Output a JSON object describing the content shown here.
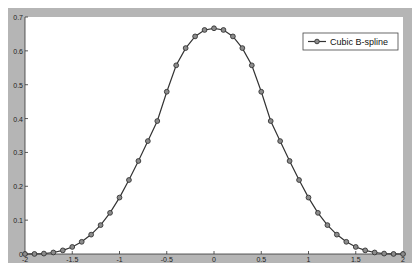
{
  "chart_data": {
    "type": "line",
    "title": "",
    "xlabel": "",
    "ylabel": "",
    "xlim": [
      -2,
      2
    ],
    "ylim": [
      0,
      0.7
    ],
    "grid": false,
    "legend_position": "upper right",
    "x_ticks": [
      -2,
      -1.5,
      -1,
      -0.5,
      0,
      0.5,
      1,
      1.5,
      2
    ],
    "x_tick_labels": [
      "-2",
      "-1.5",
      "-1",
      "-0.5",
      "0",
      "0.5",
      "1",
      "1.5",
      "2"
    ],
    "y_ticks": [
      0,
      0.1,
      0.2,
      0.3,
      0.4,
      0.5,
      0.6,
      0.7
    ],
    "y_tick_labels": [
      "0",
      "0.1",
      "0.2",
      "0.3",
      "0.4",
      "0.5",
      "0.6",
      "0.7"
    ],
    "series": [
      {
        "name": "Cubic B-spline",
        "marker": "circle",
        "color": "#333333",
        "x": [
          -2,
          -1.9,
          -1.8,
          -1.7,
          -1.6,
          -1.5,
          -1.4,
          -1.3,
          -1.2,
          -1.1,
          -1,
          -0.9,
          -0.8,
          -0.7,
          -0.6,
          -0.5,
          -0.4,
          -0.3,
          -0.2,
          -0.1,
          0,
          0.1,
          0.2,
          0.3,
          0.4,
          0.5,
          0.6,
          0.7,
          0.8,
          0.9,
          1,
          1.1,
          1.2,
          1.3,
          1.4,
          1.5,
          1.6,
          1.7,
          1.8,
          1.9,
          2
        ],
        "values": [
          0,
          0.0002,
          0.0013,
          0.0045,
          0.0107,
          0.0208,
          0.036,
          0.0572,
          0.0853,
          0.1215,
          0.1667,
          0.2185,
          0.2747,
          0.3335,
          0.3927,
          0.4792,
          0.5573,
          0.6082,
          0.6427,
          0.6617,
          0.6667,
          0.6617,
          0.6427,
          0.6082,
          0.5573,
          0.4792,
          0.3927,
          0.3335,
          0.2747,
          0.2185,
          0.1667,
          0.1215,
          0.0853,
          0.0572,
          0.036,
          0.0208,
          0.0107,
          0.0045,
          0.0013,
          0.0002,
          0
        ]
      }
    ]
  },
  "legend": {
    "label": "Cubic B-spline"
  },
  "colors": {
    "frame": "#b3b3b3",
    "line": "#333333",
    "marker_fill": "#8c8c8c"
  }
}
